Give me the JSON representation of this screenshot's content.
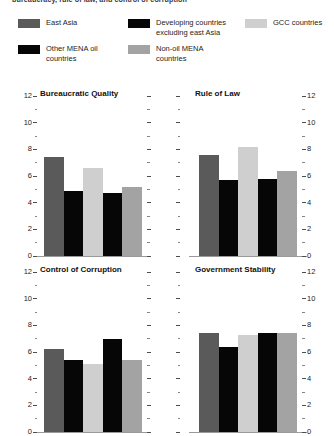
{
  "caption": {
    "text": "bureaucracy, rule of law, and control of corruption"
  },
  "legend": {
    "items": [
      {
        "label": "East Asia",
        "color": "#5a5a5a",
        "name": "legend-east-asia"
      },
      {
        "label": "Developing countries excluding east Asia",
        "color": "#060606",
        "name": "legend-developing-excluding-east-asia"
      },
      {
        "label": "GCC countries",
        "color": "#cfcfcf",
        "name": "legend-gcc-countries"
      },
      {
        "label": "Other MENA oil countries",
        "color": "#060606",
        "name": "legend-other-mena-oil-countries"
      },
      {
        "label": "Non-oil MENA countries",
        "color": "#a3a3a3",
        "name": "legend-non-oil-mena-countries"
      }
    ]
  },
  "axis": {
    "ticks_major": [
      "12",
      "10",
      "8",
      "6",
      "4",
      "2",
      "0"
    ],
    "min": 0,
    "max": 12
  },
  "chart_data": [
    {
      "type": "bar",
      "title": "Bureaucratic Quality",
      "categories": [
        "East Asia",
        "Developing countries excluding east Asia",
        "GCC countries",
        "Other MENA oil countries",
        "Non-oil MENA countries"
      ],
      "values": [
        7.4,
        4.9,
        6.6,
        4.7,
        5.2
      ],
      "colors": [
        "#5a5a5a",
        "#060606",
        "#cfcfcf",
        "#060606",
        "#a3a3a3"
      ],
      "xlabel": "",
      "ylabel": "",
      "ylim": [
        0,
        12
      ],
      "grid": false,
      "legend_position": "top"
    },
    {
      "type": "bar",
      "title": "Rule of Law",
      "categories": [
        "East Asia",
        "Developing countries excluding east Asia",
        "GCC countries",
        "Other MENA oil countries",
        "Non-oil MENA countries"
      ],
      "values": [
        7.6,
        5.7,
        8.2,
        5.8,
        6.4
      ],
      "colors": [
        "#5a5a5a",
        "#060606",
        "#cfcfcf",
        "#060606",
        "#a3a3a3"
      ],
      "xlabel": "",
      "ylabel": "",
      "ylim": [
        0,
        12
      ],
      "grid": false,
      "legend_position": "top"
    },
    {
      "type": "bar",
      "title": "Control of Corruption",
      "categories": [
        "East Asia",
        "Developing countries excluding east Asia",
        "GCC countries",
        "Other MENA oil countries",
        "Non-oil MENA countries"
      ],
      "values": [
        6.2,
        5.4,
        5.1,
        7.0,
        5.4
      ],
      "colors": [
        "#5a5a5a",
        "#060606",
        "#cfcfcf",
        "#060606",
        "#a3a3a3"
      ],
      "xlabel": "",
      "ylabel": "",
      "ylim": [
        0,
        12
      ],
      "grid": false,
      "legend_position": "top"
    },
    {
      "type": "bar",
      "title": "Government Stability",
      "categories": [
        "East Asia",
        "Developing countries excluding east Asia",
        "GCC countries",
        "Other MENA oil countries",
        "Non-oil MENA countries"
      ],
      "values": [
        7.4,
        6.4,
        7.3,
        7.4,
        7.4
      ],
      "colors": [
        "#5a5a5a",
        "#060606",
        "#cfcfcf",
        "#060606",
        "#a3a3a3"
      ],
      "xlabel": "",
      "ylabel": "",
      "ylim": [
        0,
        12
      ],
      "grid": false,
      "legend_position": "top"
    }
  ]
}
